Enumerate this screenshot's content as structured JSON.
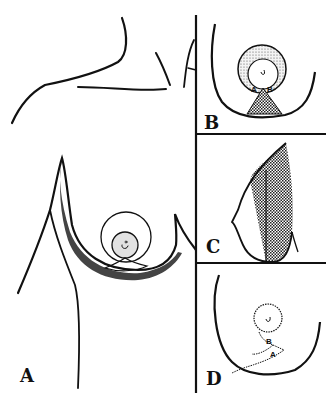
{
  "figure": {
    "type": "medical line illustration",
    "panels": [
      {
        "id": "A",
        "label": "A",
        "description": "Frontal torso view with breast, areola circle and shaded inframammary contour"
      },
      {
        "id": "B",
        "label": "B",
        "points": [
          "A",
          "B"
        ],
        "description": "Breast with stippled areola ring and hatched inferior triangle"
      },
      {
        "id": "C",
        "label": "C",
        "description": "Lateral profile with hatched posterior region"
      },
      {
        "id": "D",
        "label": "D",
        "points": [
          "B",
          "A"
        ],
        "description": "Breast with dotted areola outline and dotted inferior incision lines"
      }
    ],
    "colors": {
      "line": "#111111",
      "shadow": "#555555",
      "areola_fill": "#e2e2e2",
      "background": "#ffffff"
    }
  }
}
